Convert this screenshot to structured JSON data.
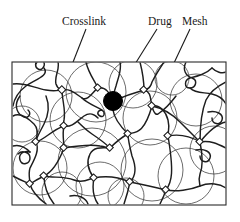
{
  "figure": {
    "kind": "schematic-diagram",
    "background_color": "#ffffff",
    "frame": {
      "name": "diagram-border",
      "x": 12,
      "y": 62,
      "width": 214,
      "height": 143,
      "stroke_color": "#2a2a2a"
    },
    "labels": [
      {
        "id": "crosslink",
        "text": "Crosslink",
        "x": 62,
        "y": 25,
        "leader": {
          "x1": 86,
          "y1": 29,
          "x2": 62,
          "y2": 89
        },
        "target": "crosslink-node"
      },
      {
        "id": "drug",
        "text": "Drug",
        "x": 148,
        "y": 25,
        "leader": {
          "x1": 157,
          "y1": 29,
          "x2": 116,
          "y2": 94
        },
        "target": "drug-particle"
      },
      {
        "id": "mesh",
        "text": "Mesh",
        "x": 182,
        "y": 25,
        "leader": {
          "x1": 190,
          "y1": 29,
          "x2": 157,
          "y2": 99
        },
        "target": "mesh-circle"
      }
    ],
    "drug_particle": {
      "name": "drug-particle",
      "cx": 113,
      "cy": 101,
      "r": 9.5,
      "color": "#000000"
    },
    "mesh_circles": [
      {
        "cx": 46,
        "cy": 96,
        "r": 26
      },
      {
        "cx": 96,
        "cy": 92,
        "r": 30
      },
      {
        "cx": 78,
        "cy": 120,
        "r": 28
      },
      {
        "cx": 133,
        "cy": 84,
        "r": 24
      },
      {
        "cx": 150,
        "cy": 118,
        "r": 27
      },
      {
        "cx": 196,
        "cy": 100,
        "r": 26
      },
      {
        "cx": 40,
        "cy": 168,
        "r": 27
      },
      {
        "cx": 92,
        "cy": 162,
        "r": 34
      },
      {
        "cx": 100,
        "cy": 186,
        "r": 24
      },
      {
        "cx": 152,
        "cy": 170,
        "r": 31
      },
      {
        "cx": 186,
        "cy": 176,
        "r": 28
      },
      {
        "cx": 214,
        "cy": 150,
        "r": 24
      },
      {
        "cx": 62,
        "cy": 192,
        "r": 20
      },
      {
        "cx": 126,
        "cy": 196,
        "r": 18
      }
    ],
    "crosslink_nodes": [
      {
        "cx": 62,
        "cy": 90
      },
      {
        "cx": 98,
        "cy": 88
      },
      {
        "cx": 144,
        "cy": 90
      },
      {
        "cx": 152,
        "cy": 106
      },
      {
        "cx": 64,
        "cy": 126
      },
      {
        "cx": 36,
        "cy": 142
      },
      {
        "cx": 128,
        "cy": 134
      },
      {
        "cx": 168,
        "cy": 136
      },
      {
        "cx": 64,
        "cy": 148
      },
      {
        "cx": 110,
        "cy": 148
      },
      {
        "cx": 44,
        "cy": 176
      },
      {
        "cx": 94,
        "cy": 178
      },
      {
        "cx": 130,
        "cy": 182
      },
      {
        "cx": 166,
        "cy": 190
      },
      {
        "cx": 200,
        "cy": 142
      },
      {
        "cx": 30,
        "cy": 184
      }
    ],
    "chain_count": 18,
    "legend_note": ""
  }
}
